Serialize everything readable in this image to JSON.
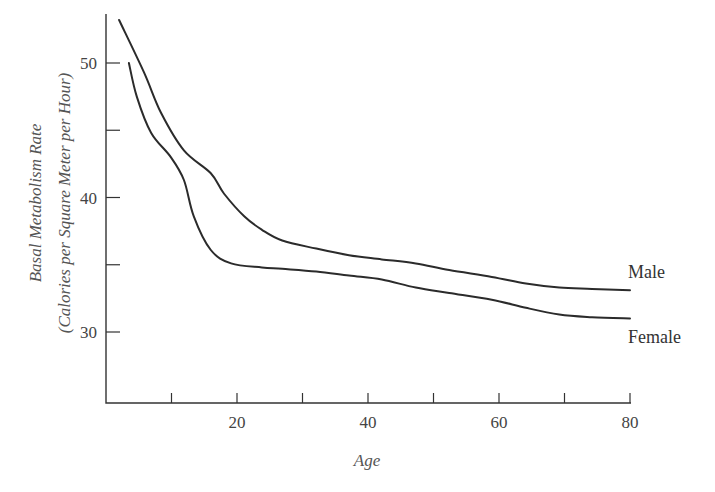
{
  "chart_data": {
    "type": "line",
    "title": "",
    "xlabel": "Age",
    "ylabel": [
      "Basal Metabolism Rate",
      "(Calories per Square Meter per Hour)"
    ],
    "xlim": [
      0,
      80
    ],
    "ylim": [
      25,
      54
    ],
    "x_ticks": [
      10,
      20,
      30,
      40,
      50,
      60,
      70,
      80
    ],
    "x_tick_labels": [
      {
        "value": 20,
        "label": "20"
      },
      {
        "value": 40,
        "label": "40"
      },
      {
        "value": 60,
        "label": "60"
      },
      {
        "value": 80,
        "label": "80"
      }
    ],
    "y_ticks": [
      30,
      35,
      40,
      45,
      50
    ],
    "y_tick_labels": [
      {
        "value": 30,
        "label": "30"
      },
      {
        "value": 40,
        "label": "40"
      },
      {
        "value": 50,
        "label": "50"
      }
    ],
    "grid": false,
    "legend": "inline labels at right end of curves",
    "series": [
      {
        "name": "Male",
        "x": [
          2,
          5.8,
          8.4,
          11.9,
          16,
          18,
          21.1,
          23.8,
          26.9,
          32.1,
          37.1,
          42.1,
          47.3,
          52.4,
          58.9,
          64.1,
          69.2,
          74.2,
          80
        ],
        "values": [
          53.2,
          49.3,
          46.3,
          43.5,
          41.8,
          40.3,
          38.6,
          37.6,
          36.8,
          36.2,
          35.7,
          35.4,
          35.1,
          34.6,
          34.1,
          33.6,
          33.3,
          33.2,
          33.1
        ]
      },
      {
        "name": "Female",
        "x": [
          3.5,
          4.7,
          6.9,
          9.9,
          11.9,
          13.4,
          16,
          19.1,
          23.8,
          26.9,
          32.1,
          37.1,
          42.1,
          47.3,
          52.4,
          58.9,
          64.1,
          69.2,
          74.2,
          80
        ],
        "values": [
          50.0,
          47.5,
          44.8,
          43.0,
          41.3,
          38.6,
          36.1,
          35.1,
          34.8,
          34.7,
          34.5,
          34.2,
          33.9,
          33.3,
          32.9,
          32.4,
          31.8,
          31.3,
          31.1,
          31.0
        ]
      }
    ]
  },
  "labels": {
    "x_axis_title": "Age",
    "y_axis_title_line1": "Basal Metabolism Rate",
    "y_axis_title_line2": "(Calories per Square Meter per Hour)",
    "male": "Male",
    "female": "Female"
  }
}
